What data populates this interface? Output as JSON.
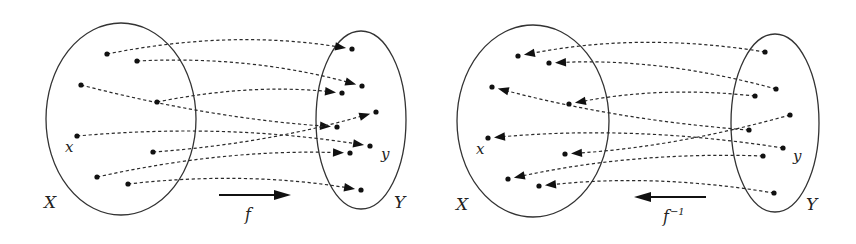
{
  "colors": {
    "ink": "#111111",
    "ellipse": "#333333",
    "dash": "#2a2a2a",
    "background": "#ffffff"
  },
  "panels": [
    {
      "id": "forward",
      "direction": "forward",
      "domain_set": {
        "label": "X",
        "cx": 121,
        "cy": 119,
        "rx": 75,
        "ry": 96,
        "label_x": 44,
        "label_y": 208
      },
      "codomain_set": {
        "label": "Y",
        "cx": 361,
        "cy": 120,
        "rx": 45,
        "ry": 89,
        "label_x": 394,
        "label_y": 208
      },
      "points_domain": [
        [
          107,
          54
        ],
        [
          137,
          61
        ],
        [
          81,
          85
        ],
        [
          157,
          102
        ],
        [
          77,
          136
        ],
        [
          153,
          152
        ],
        [
          97,
          177
        ],
        [
          128,
          184
        ]
      ],
      "points_codomain": [
        [
          352,
          49
        ],
        [
          362,
          86
        ],
        [
          342,
          93
        ],
        [
          376,
          112
        ],
        [
          337,
          127
        ],
        [
          370,
          146
        ],
        [
          350,
          153
        ],
        [
          361,
          190
        ]
      ],
      "mapping": [
        0,
        1,
        4,
        2,
        5,
        3,
        6,
        7
      ],
      "arc_bulge": [
        -22,
        -18,
        12,
        -14,
        -18,
        12,
        -16,
        -16
      ],
      "point_labels": [
        {
          "text": "x",
          "x": 65,
          "y": 152
        },
        {
          "text": "y",
          "x": 381,
          "y": 159
        }
      ],
      "function_arrow": {
        "x1": 219,
        "x2": 291,
        "y": 195,
        "label": "f",
        "label_x": 245,
        "label_y": 220,
        "superscript": ""
      }
    },
    {
      "id": "inverse",
      "direction": "inverse",
      "domain_set": {
        "label": "X",
        "cx": 533,
        "cy": 121,
        "rx": 76,
        "ry": 96,
        "label_x": 456,
        "label_y": 210
      },
      "codomain_set": {
        "label": "Y",
        "cx": 775,
        "cy": 123,
        "rx": 44,
        "ry": 89,
        "label_x": 806,
        "label_y": 210
      },
      "points_domain": [
        [
          518,
          56
        ],
        [
          549,
          63
        ],
        [
          492,
          87
        ],
        [
          569,
          104
        ],
        [
          488,
          138
        ],
        [
          565,
          154
        ],
        [
          508,
          179
        ],
        [
          539,
          186
        ]
      ],
      "points_codomain": [
        [
          765,
          52
        ],
        [
          776,
          89
        ],
        [
          755,
          96
        ],
        [
          790,
          115
        ],
        [
          749,
          130
        ],
        [
          783,
          148
        ],
        [
          763,
          156
        ],
        [
          774,
          193
        ]
      ],
      "mapping": [
        0,
        1,
        4,
        2,
        5,
        3,
        6,
        7
      ],
      "arc_bulge": [
        -22,
        -18,
        12,
        -14,
        -18,
        12,
        -16,
        -16
      ],
      "point_labels": [
        {
          "text": "x",
          "x": 476,
          "y": 154
        },
        {
          "text": "y",
          "x": 793,
          "y": 161
        }
      ],
      "function_arrow": {
        "x1": 706,
        "x2": 634,
        "y": 197,
        "label": "f",
        "label_x": 663,
        "label_y": 222,
        "superscript": "−1"
      }
    }
  ]
}
